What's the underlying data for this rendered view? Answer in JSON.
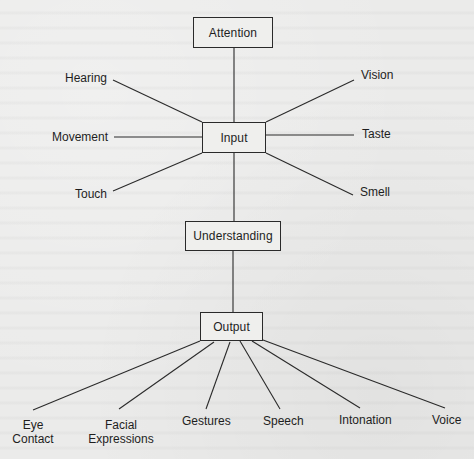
{
  "diagram": {
    "nodes": {
      "attention": "Attention",
      "input": "Input",
      "understanding": "Understanding",
      "output": "Output"
    },
    "inputs": {
      "hearing": "Hearing",
      "vision": "Vision",
      "movement": "Movement",
      "taste": "Taste",
      "touch": "Touch",
      "smell": "Smell"
    },
    "outputs": {
      "eye_contact": [
        "Eye",
        "Contact"
      ],
      "facial_expressions": [
        "Facial",
        "Expressions"
      ],
      "gestures": "Gestures",
      "speech": "Speech",
      "intonation": "Intonation",
      "voice": "Voice"
    },
    "edges": [
      [
        "Attention",
        "Input"
      ],
      [
        "Hearing",
        "Input"
      ],
      [
        "Vision",
        "Input"
      ],
      [
        "Movement",
        "Input"
      ],
      [
        "Taste",
        "Input"
      ],
      [
        "Touch",
        "Input"
      ],
      [
        "Smell",
        "Input"
      ],
      [
        "Input",
        "Understanding"
      ],
      [
        "Understanding",
        "Output"
      ],
      [
        "Output",
        "Eye Contact"
      ],
      [
        "Output",
        "Facial Expressions"
      ],
      [
        "Output",
        "Gestures"
      ],
      [
        "Output",
        "Speech"
      ],
      [
        "Output",
        "Intonation"
      ],
      [
        "Output",
        "Voice"
      ]
    ],
    "colors": {
      "line": "#2a2a2a",
      "text": "#1e1e1e",
      "paper": "#ebebea"
    }
  }
}
